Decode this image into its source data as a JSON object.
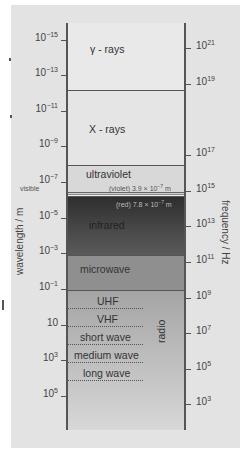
{
  "left_axis": {
    "title": "wavelength / m",
    "ticks": [
      {
        "base": "10",
        "exp": "−15",
        "y": 40
      },
      {
        "base": "10",
        "exp": "−13",
        "y": 75
      },
      {
        "base": "10",
        "exp": "−11",
        "y": 111
      },
      {
        "base": "10",
        "exp": "−9",
        "y": 146
      },
      {
        "base": "10",
        "exp": "−7",
        "y": 182
      },
      {
        "base": "10",
        "exp": "−5",
        "y": 218
      },
      {
        "base": "10",
        "exp": "−3",
        "y": 253
      },
      {
        "base": "10",
        "exp": "−1",
        "y": 289
      },
      {
        "base": "10",
        "exp": "",
        "y": 325
      },
      {
        "base": "10",
        "exp": "3",
        "y": 360
      },
      {
        "base": "10",
        "exp": "5",
        "y": 396
      }
    ],
    "visible_label": "visible"
  },
  "right_axis": {
    "title": "frequency / Hz",
    "ticks": [
      {
        "base": "10",
        "exp": "21",
        "y": 48
      },
      {
        "base": "10",
        "exp": "19",
        "y": 84
      },
      {
        "base": "10",
        "exp": "17",
        "y": 155
      },
      {
        "base": "10",
        "exp": "15",
        "y": 191
      },
      {
        "base": "10",
        "exp": "13",
        "y": 226
      },
      {
        "base": "10",
        "exp": "11",
        "y": 262
      },
      {
        "base": "10",
        "exp": "9",
        "y": 298
      },
      {
        "base": "10",
        "exp": "7",
        "y": 333
      },
      {
        "base": "10",
        "exp": "5",
        "y": 369
      },
      {
        "base": "10",
        "exp": "3",
        "y": 404
      }
    ]
  },
  "bands": {
    "gamma": "γ - rays",
    "xray": "X - rays",
    "ultraviolet": "ultraviolet",
    "violet_note": "(violet) 3.9 × 10",
    "violet_exp": "−7",
    "violet_unit": " m",
    "red_note": "(red) 7.8 × 10",
    "red_exp": "−7",
    "red_unit": " m",
    "infrared": "infrared",
    "microwave": "microwave",
    "radio": "radio",
    "radio_sub": [
      "UHF",
      "VHF",
      "short wave",
      "medium wave",
      "long wave"
    ]
  },
  "colors": {
    "panel_bg": "#e3e3e3",
    "gamma_bg": "#e9e9e9",
    "xray_bg": "#e6e6e6",
    "uv_bg": "#dadada",
    "infrared_dark": "#3a3a3a",
    "microwave_bg": "#8e8e8e",
    "radio_top": "#a6a6a6",
    "radio_bottom": "#d9d9d9",
    "line": "#555555"
  }
}
